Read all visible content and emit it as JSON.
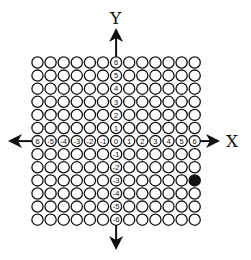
{
  "diagram": {
    "type": "coordinate-grid",
    "x_axis_label": "X",
    "y_axis_label": "Y",
    "x_range": [
      -6,
      6
    ],
    "y_range": [
      -6,
      6
    ],
    "grid_columns": 13,
    "grid_rows": 13,
    "x_tick_labels": [
      "6",
      "-5",
      "-4",
      "-3",
      "-2",
      "-1",
      "0",
      "1",
      "2",
      "3",
      "4",
      "5",
      "6"
    ],
    "y_tick_labels_positive": [
      "6",
      "5",
      "4",
      "3",
      "2",
      "1"
    ],
    "y_tick_labels_negative": [
      "-1",
      "-2",
      "-3",
      "-4",
      "-5",
      "-6"
    ],
    "filled_points": [
      {
        "x": 6,
        "y": -3
      }
    ],
    "colors": {
      "stroke": "#111111",
      "fill_point": "#111111",
      "background": "#ffffff"
    }
  }
}
